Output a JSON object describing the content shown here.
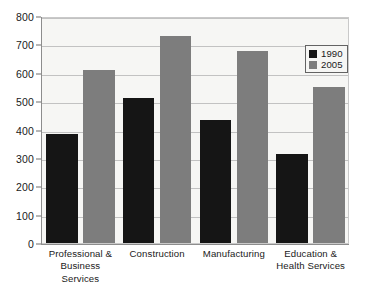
{
  "chart_data": {
    "type": "bar",
    "title": "",
    "subtitle": "",
    "xlabel": "",
    "ylabel": "",
    "categories": [
      "Professional & Business Services",
      "Construction",
      "Manufacturing",
      "Education & Health Services"
    ],
    "category_lines": [
      [
        "Professional &",
        "Business Services"
      ],
      [
        "Construction"
      ],
      [
        "Manufacturing"
      ],
      [
        "Education &",
        "Health Services"
      ]
    ],
    "series": [
      {
        "name": "1990",
        "color": "#151515",
        "values": [
          383,
          510,
          435,
          315
        ]
      },
      {
        "name": "2005",
        "color": "#7d7d7d",
        "values": [
          610,
          730,
          678,
          550
        ]
      }
    ],
    "ylim": [
      0,
      800
    ],
    "yticks": [
      0,
      100,
      200,
      300,
      400,
      500,
      600,
      700,
      800
    ],
    "ytick_labels": [
      "0",
      "100",
      "200",
      "300",
      "400",
      "500",
      "600",
      "700",
      "800"
    ],
    "grid": true,
    "grid_axis": "y",
    "legend": {
      "position": "upper right",
      "entries": [
        {
          "label": "1990",
          "color": "#151515"
        },
        {
          "label": "2005",
          "color": "#7d7d7d"
        }
      ]
    },
    "plot_background": "#f6f6f4",
    "figure_background": "#ffffff",
    "annotations": []
  }
}
